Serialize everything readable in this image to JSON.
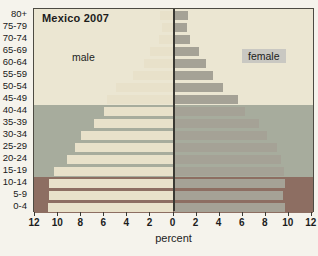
{
  "title": "Mexico 2007",
  "labels": {
    "male": "male",
    "female": "female",
    "x_axis": "percent"
  },
  "colors": {
    "outer_background": "#f5f3ec",
    "band_post_reproductive": "#ebe6d2",
    "band_reproductive": "#a7ac9d",
    "band_pre_reproductive": "#8d6e62",
    "male_bar": "#e8e1ca",
    "female_bar": "#a5a296",
    "center_line": "#3a3933",
    "plot_border": "#4d4b43",
    "female_label_chip": "#c9c8c2"
  },
  "chart_data": {
    "type": "bar",
    "subtype": "population-pyramid",
    "title": "Mexico 2007",
    "orientation": "horizontal",
    "categories": [
      "80+",
      "75-79",
      "70-74",
      "65-69",
      "60-64",
      "55-59",
      "50-54",
      "45-49",
      "40-44",
      "35-39",
      "30-34",
      "25-29",
      "20-24",
      "15-19",
      "10-14",
      "5-9",
      "0-4"
    ],
    "series": [
      {
        "name": "male",
        "side": "left",
        "color": "#e8e1ca",
        "values": [
          1.2,
          1.0,
          1.3,
          2.0,
          2.6,
          3.5,
          5.0,
          5.8,
          6.0,
          6.9,
          8.0,
          8.5,
          9.2,
          10.4,
          10.8,
          10.8,
          10.9
        ]
      },
      {
        "name": "female",
        "side": "right",
        "color": "#a5a296",
        "values": [
          1.3,
          1.2,
          1.4,
          2.2,
          2.8,
          3.4,
          4.3,
          5.6,
          6.2,
          7.4,
          8.1,
          9.0,
          9.3,
          9.6,
          9.7,
          9.5,
          9.7
        ]
      }
    ],
    "xlabel": "percent",
    "x_ticks": [
      12,
      10,
      8,
      6,
      4,
      2,
      0,
      2,
      4,
      6,
      8,
      10,
      12
    ],
    "xlim": [
      -12.2,
      12.2
    ],
    "grid": false,
    "background_bands": [
      {
        "categories_from": "80+",
        "categories_to": "45-49",
        "color": "#ebe6d2"
      },
      {
        "categories_from": "40-44",
        "categories_to": "15-19",
        "color": "#a7ac9d"
      },
      {
        "categories_from": "10-14",
        "categories_to": "0-4",
        "color": "#8d6e62"
      }
    ]
  }
}
